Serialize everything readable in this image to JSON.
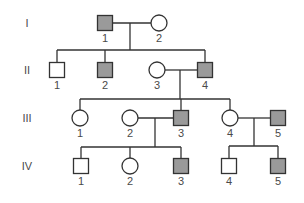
{
  "colors": {
    "affected_fill": "#9a9a9a",
    "unaffected_fill": "#ffffff",
    "line": "#333333",
    "label": "#4a4a4a"
  },
  "generations": [
    {
      "label": "I",
      "y": 23
    },
    {
      "label": "II",
      "y": 70
    },
    {
      "label": "III",
      "y": 118
    },
    {
      "label": "IV",
      "y": 166
    }
  ],
  "individuals": [
    {
      "id": "I-1",
      "gen": 0,
      "label": "1",
      "sex": "male",
      "affected": true,
      "x": 105
    },
    {
      "id": "I-2",
      "gen": 0,
      "label": "2",
      "sex": "female",
      "affected": false,
      "x": 159
    },
    {
      "id": "II-1",
      "gen": 1,
      "label": "1",
      "sex": "male",
      "affected": false,
      "x": 57
    },
    {
      "id": "II-2",
      "gen": 1,
      "label": "2",
      "sex": "male",
      "affected": true,
      "x": 105
    },
    {
      "id": "II-3",
      "gen": 1,
      "label": "3",
      "sex": "female",
      "affected": false,
      "x": 157
    },
    {
      "id": "II-4",
      "gen": 1,
      "label": "4",
      "sex": "male",
      "affected": true,
      "x": 205
    },
    {
      "id": "III-1",
      "gen": 2,
      "label": "1",
      "sex": "female",
      "affected": false,
      "x": 80
    },
    {
      "id": "III-2",
      "gen": 2,
      "label": "2",
      "sex": "female",
      "affected": false,
      "x": 130
    },
    {
      "id": "III-3",
      "gen": 2,
      "label": "3",
      "sex": "male",
      "affected": true,
      "x": 181
    },
    {
      "id": "III-4",
      "gen": 2,
      "label": "4",
      "sex": "female",
      "affected": false,
      "x": 230
    },
    {
      "id": "III-5",
      "gen": 2,
      "label": "5",
      "sex": "male",
      "affected": true,
      "x": 278
    },
    {
      "id": "IV-1",
      "gen": 3,
      "label": "1",
      "sex": "male",
      "affected": false,
      "x": 81
    },
    {
      "id": "IV-2",
      "gen": 3,
      "label": "2",
      "sex": "female",
      "affected": false,
      "x": 130
    },
    {
      "id": "IV-3",
      "gen": 3,
      "label": "3",
      "sex": "male",
      "affected": true,
      "x": 181
    },
    {
      "id": "IV-4",
      "gen": 3,
      "label": "4",
      "sex": "male",
      "affected": false,
      "x": 229
    },
    {
      "id": "IV-5",
      "gen": 3,
      "label": "5",
      "sex": "male",
      "affected": true,
      "x": 278
    }
  ],
  "lines": [
    {
      "name": "couple-I1-I2",
      "x1": 113,
      "y1": 23,
      "x2": 151,
      "y2": 23
    },
    {
      "name": "descent-I",
      "x1": 130,
      "y1": 23,
      "x2": 130,
      "y2": 50
    },
    {
      "name": "sibship-II",
      "x1": 57,
      "y1": 50,
      "x2": 205,
      "y2": 50
    },
    {
      "name": "drop-II1",
      "x1": 57,
      "y1": 50,
      "x2": 57,
      "y2": 62
    },
    {
      "name": "drop-II2",
      "x1": 105,
      "y1": 50,
      "x2": 105,
      "y2": 62
    },
    {
      "name": "drop-II4",
      "x1": 205,
      "y1": 50,
      "x2": 205,
      "y2": 62
    },
    {
      "name": "couple-II3-II4",
      "x1": 165,
      "y1": 70,
      "x2": 197,
      "y2": 70
    },
    {
      "name": "descent-II",
      "x1": 180,
      "y1": 70,
      "x2": 180,
      "y2": 99
    },
    {
      "name": "sibship-III",
      "x1": 80,
      "y1": 99,
      "x2": 230,
      "y2": 99
    },
    {
      "name": "drop-III1",
      "x1": 80,
      "y1": 99,
      "x2": 80,
      "y2": 110
    },
    {
      "name": "drop-III3",
      "x1": 181,
      "y1": 99,
      "x2": 181,
      "y2": 110
    },
    {
      "name": "drop-III4",
      "x1": 230,
      "y1": 99,
      "x2": 230,
      "y2": 110
    },
    {
      "name": "couple-III2-III3",
      "x1": 138,
      "y1": 118,
      "x2": 173,
      "y2": 118
    },
    {
      "name": "descent-III-left",
      "x1": 155,
      "y1": 118,
      "x2": 155,
      "y2": 147
    },
    {
      "name": "sibship-IV-left",
      "x1": 81,
      "y1": 147,
      "x2": 181,
      "y2": 147
    },
    {
      "name": "drop-IV1",
      "x1": 81,
      "y1": 147,
      "x2": 81,
      "y2": 158
    },
    {
      "name": "drop-IV2",
      "x1": 130,
      "y1": 147,
      "x2": 130,
      "y2": 158
    },
    {
      "name": "drop-IV3",
      "x1": 181,
      "y1": 147,
      "x2": 181,
      "y2": 158
    },
    {
      "name": "couple-III4-III5",
      "x1": 238,
      "y1": 118,
      "x2": 270,
      "y2": 118
    },
    {
      "name": "descent-III-right",
      "x1": 254,
      "y1": 118,
      "x2": 254,
      "y2": 146
    },
    {
      "name": "sibship-IV-right",
      "x1": 229,
      "y1": 146,
      "x2": 278,
      "y2": 146
    },
    {
      "name": "drop-IV4",
      "x1": 229,
      "y1": 146,
      "x2": 229,
      "y2": 158
    },
    {
      "name": "drop-IV5",
      "x1": 278,
      "y1": 146,
      "x2": 278,
      "y2": 158
    }
  ],
  "symbol_size": 15,
  "label_offset": 18,
  "gen_label_x": 27
}
